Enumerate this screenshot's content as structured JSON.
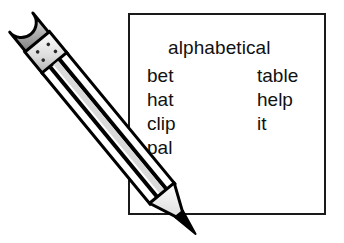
{
  "canvas": {
    "width": 344,
    "height": 243,
    "background": "#ffffff"
  },
  "word_box": {
    "border_color": "#1a1a1a",
    "heading": "alphabetical",
    "columns": [
      {
        "name": "left-column",
        "words": [
          "bet",
          "hat",
          "clip",
          "pal"
        ]
      },
      {
        "name": "right-column",
        "words": [
          "table",
          "help",
          "it"
        ]
      }
    ]
  },
  "pencil": {
    "eraser_color": "#9a9a9a",
    "eraser_highlight": "#d8d8d8",
    "ferrule_color": "#e2e2e2",
    "barrel_light": "#ffffff",
    "barrel_shade": "#d0d0d0",
    "wood_color": "#efefef",
    "graphite_color": "#000000",
    "outline_color": "#000000"
  }
}
